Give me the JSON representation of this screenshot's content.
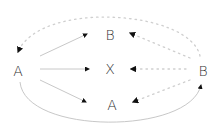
{
  "diagram": {
    "nodes": [
      {
        "id": "left-a",
        "label": "A",
        "x": 18,
        "y": 71
      },
      {
        "id": "top-b",
        "label": "B",
        "x": 110,
        "y": 35
      },
      {
        "id": "center-x",
        "label": "X",
        "x": 110,
        "y": 69
      },
      {
        "id": "bottom-a",
        "label": "A",
        "x": 112,
        "y": 105
      },
      {
        "id": "right-b",
        "label": "B",
        "x": 203,
        "y": 71
      }
    ],
    "edges": [
      {
        "from": "left-a",
        "to": "top-b",
        "style": "solid"
      },
      {
        "from": "left-a",
        "to": "center-x",
        "style": "solid"
      },
      {
        "from": "left-a",
        "to": "bottom-a",
        "style": "solid"
      },
      {
        "from": "right-b",
        "to": "top-b",
        "style": "dotted"
      },
      {
        "from": "right-b",
        "to": "center-x",
        "style": "dotted"
      },
      {
        "from": "right-b",
        "to": "bottom-a",
        "style": "dotted"
      },
      {
        "from": "right-b",
        "to": "left-a",
        "style": "dotted",
        "path": "arc-top"
      },
      {
        "from": "left-a",
        "to": "right-b",
        "style": "solid",
        "path": "arc-bottom"
      }
    ],
    "colors": {
      "solid_line": "#c8c8c8",
      "dotted_line": "#cfcfcf",
      "arrowhead": "#111111",
      "label": "#333333"
    }
  }
}
